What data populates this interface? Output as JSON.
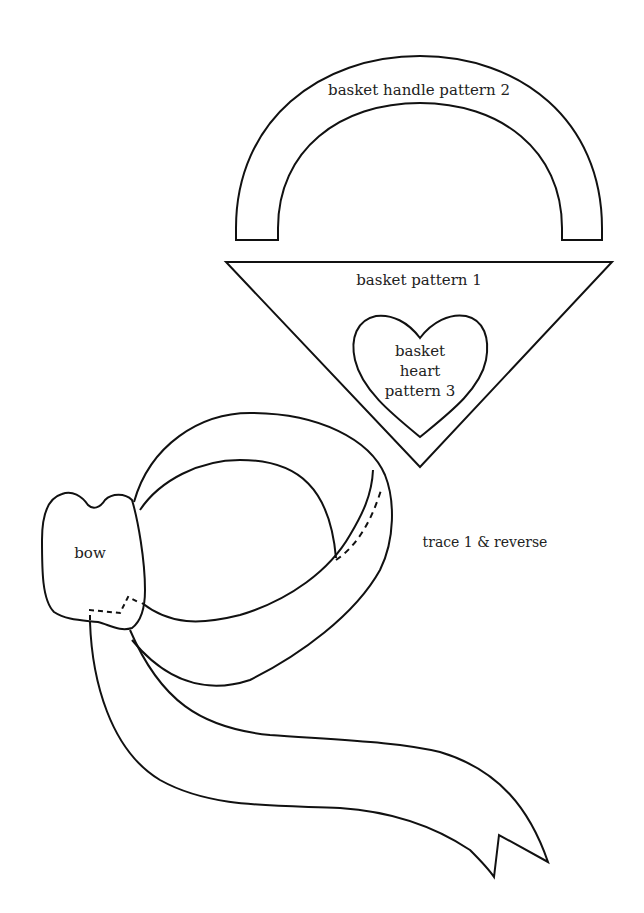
{
  "colors": {
    "line": "#111111",
    "text": "#222222",
    "background": "#ffffff"
  },
  "pieces": [
    {
      "id": "handle",
      "label": "basket handle pattern 2"
    },
    {
      "id": "basket",
      "label": "basket pattern 1"
    },
    {
      "id": "heart",
      "label_lines": [
        "basket",
        "heart",
        "pattern 3"
      ]
    },
    {
      "id": "bow",
      "label": "bow"
    }
  ],
  "notes": {
    "trace": "trace 1 & reverse"
  },
  "line_styles": {
    "cut_line": "solid",
    "fold_or_stitch_line": "dashed"
  }
}
